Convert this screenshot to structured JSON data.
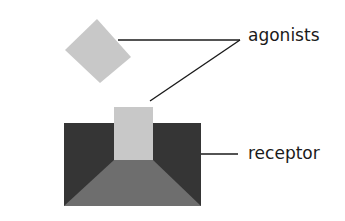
{
  "diagram": {
    "labels": {
      "agonists": "agonists",
      "receptor": "receptor"
    },
    "colors": {
      "agonist_fill": "#c8c8c8",
      "receptor_dark": "#353535",
      "receptor_floor": "#6e6e6e",
      "leader_line": "#1a1a1a"
    }
  }
}
